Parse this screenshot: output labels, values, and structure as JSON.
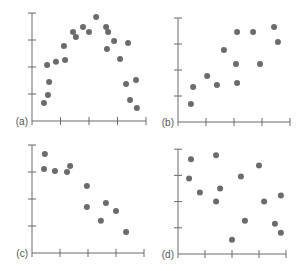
{
  "figure": {
    "style": {
      "axis_color": "#6a6a6a",
      "dot_color": "#6b6b6b",
      "label_color": "#555555",
      "dot_radius": 3
    }
  },
  "chart_data": [
    {
      "type": "scatter",
      "panel_label": "(a)",
      "title": "",
      "xlabel": "",
      "ylabel": "",
      "xlim": [
        0,
        4
      ],
      "ylim": [
        0,
        4
      ],
      "xticks": [
        0,
        1,
        2,
        3,
        4
      ],
      "yticks": [
        0,
        1,
        2,
        3,
        4
      ],
      "tick_labels_shown": false,
      "grid": false,
      "layout": {
        "origin_x": 32,
        "origin_y": 121,
        "x_unit": 28.5,
        "y_unit": 27
      },
      "points": [
        [
          0.42,
          0.67
        ],
        [
          0.56,
          0.96
        ],
        [
          0.6,
          1.44
        ],
        [
          0.53,
          2.07
        ],
        [
          0.84,
          2.19
        ],
        [
          1.12,
          2.78
        ],
        [
          1.16,
          2.26
        ],
        [
          1.44,
          3.3
        ],
        [
          1.54,
          3.11
        ],
        [
          1.79,
          3.48
        ],
        [
          2.0,
          3.3
        ],
        [
          2.25,
          3.85
        ],
        [
          2.6,
          3.48
        ],
        [
          2.67,
          3.3
        ],
        [
          2.63,
          2.67
        ],
        [
          2.88,
          2.96
        ],
        [
          3.37,
          2.89
        ],
        [
          3.09,
          2.3
        ],
        [
          3.3,
          1.37
        ],
        [
          3.65,
          1.52
        ],
        [
          3.44,
          0.78
        ],
        [
          3.68,
          0.48
        ]
      ]
    },
    {
      "type": "scatter",
      "panel_label": "(b)",
      "title": "",
      "xlabel": "",
      "ylabel": "",
      "xlim": [
        0,
        4
      ],
      "ylim": [
        0,
        4
      ],
      "xticks": [
        0,
        1,
        2,
        3,
        4
      ],
      "yticks": [
        0,
        1,
        2,
        3,
        4
      ],
      "tick_labels_shown": false,
      "grid": false,
      "layout": {
        "origin_x": 178,
        "origin_y": 122,
        "x_unit": 28,
        "y_unit": 26
      },
      "points": [
        [
          0.46,
          0.69
        ],
        [
          0.54,
          1.35
        ],
        [
          1.04,
          1.77
        ],
        [
          1.39,
          1.42
        ],
        [
          1.64,
          2.77
        ],
        [
          2.11,
          3.46
        ],
        [
          2.07,
          2.23
        ],
        [
          2.11,
          1.5
        ],
        [
          2.68,
          3.46
        ],
        [
          2.93,
          2.23
        ],
        [
          3.43,
          3.65
        ],
        [
          3.57,
          3.08
        ]
      ]
    },
    {
      "type": "scatter",
      "panel_label": "(c)",
      "title": "",
      "xlabel": "",
      "ylabel": "",
      "xlim": [
        0,
        4
      ],
      "ylim": [
        0,
        4
      ],
      "xticks": [
        0,
        1,
        2,
        3,
        4
      ],
      "yticks": [
        0,
        1,
        2,
        3,
        4
      ],
      "tick_labels_shown": false,
      "grid": false,
      "layout": {
        "origin_x": 32,
        "origin_y": 253,
        "x_unit": 28,
        "y_unit": 27
      },
      "points": [
        [
          0.46,
          3.67
        ],
        [
          0.43,
          3.11
        ],
        [
          0.82,
          3.04
        ],
        [
          1.25,
          3.0
        ],
        [
          1.36,
          3.22
        ],
        [
          1.96,
          2.48
        ],
        [
          1.96,
          1.7
        ],
        [
          2.64,
          1.85
        ],
        [
          3.0,
          1.56
        ],
        [
          2.46,
          1.19
        ],
        [
          3.36,
          0.78
        ]
      ]
    },
    {
      "type": "scatter",
      "panel_label": "(d)",
      "title": "",
      "xlabel": "",
      "ylabel": "",
      "xlim": [
        0,
        4
      ],
      "ylim": [
        0,
        4
      ],
      "xticks": [
        0,
        1,
        2,
        3,
        4
      ],
      "yticks": [
        0,
        1,
        2,
        3,
        4
      ],
      "tick_labels_shown": false,
      "grid": false,
      "layout": {
        "origin_x": 178,
        "origin_y": 254,
        "x_unit": 27,
        "y_unit": 26.2
      },
      "points": [
        [
          0.48,
          3.62
        ],
        [
          1.41,
          3.77
        ],
        [
          0.41,
          2.88
        ],
        [
          0.81,
          2.35
        ],
        [
          1.56,
          2.5
        ],
        [
          1.41,
          2.0
        ],
        [
          2.33,
          2.96
        ],
        [
          3.0,
          3.38
        ],
        [
          3.19,
          2.0
        ],
        [
          3.81,
          2.23
        ],
        [
          2.48,
          1.27
        ],
        [
          2.0,
          0.54
        ],
        [
          3.59,
          1.15
        ],
        [
          3.81,
          0.81
        ]
      ]
    }
  ]
}
